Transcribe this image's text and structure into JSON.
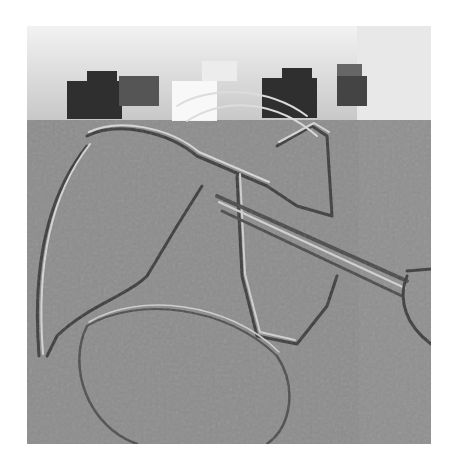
{
  "image": {
    "description": "Edge-filtered (embossed) grayscale photograph with a pixelated lighter band across the top",
    "colors": {
      "background": "#ffffff",
      "base_gray": "#8c8c8c",
      "light_band": "#e6e6e6",
      "dark_patch": "#2e2e2e",
      "edge_light": "#d0d0d0",
      "edge_dark": "#4a4a4a"
    }
  }
}
